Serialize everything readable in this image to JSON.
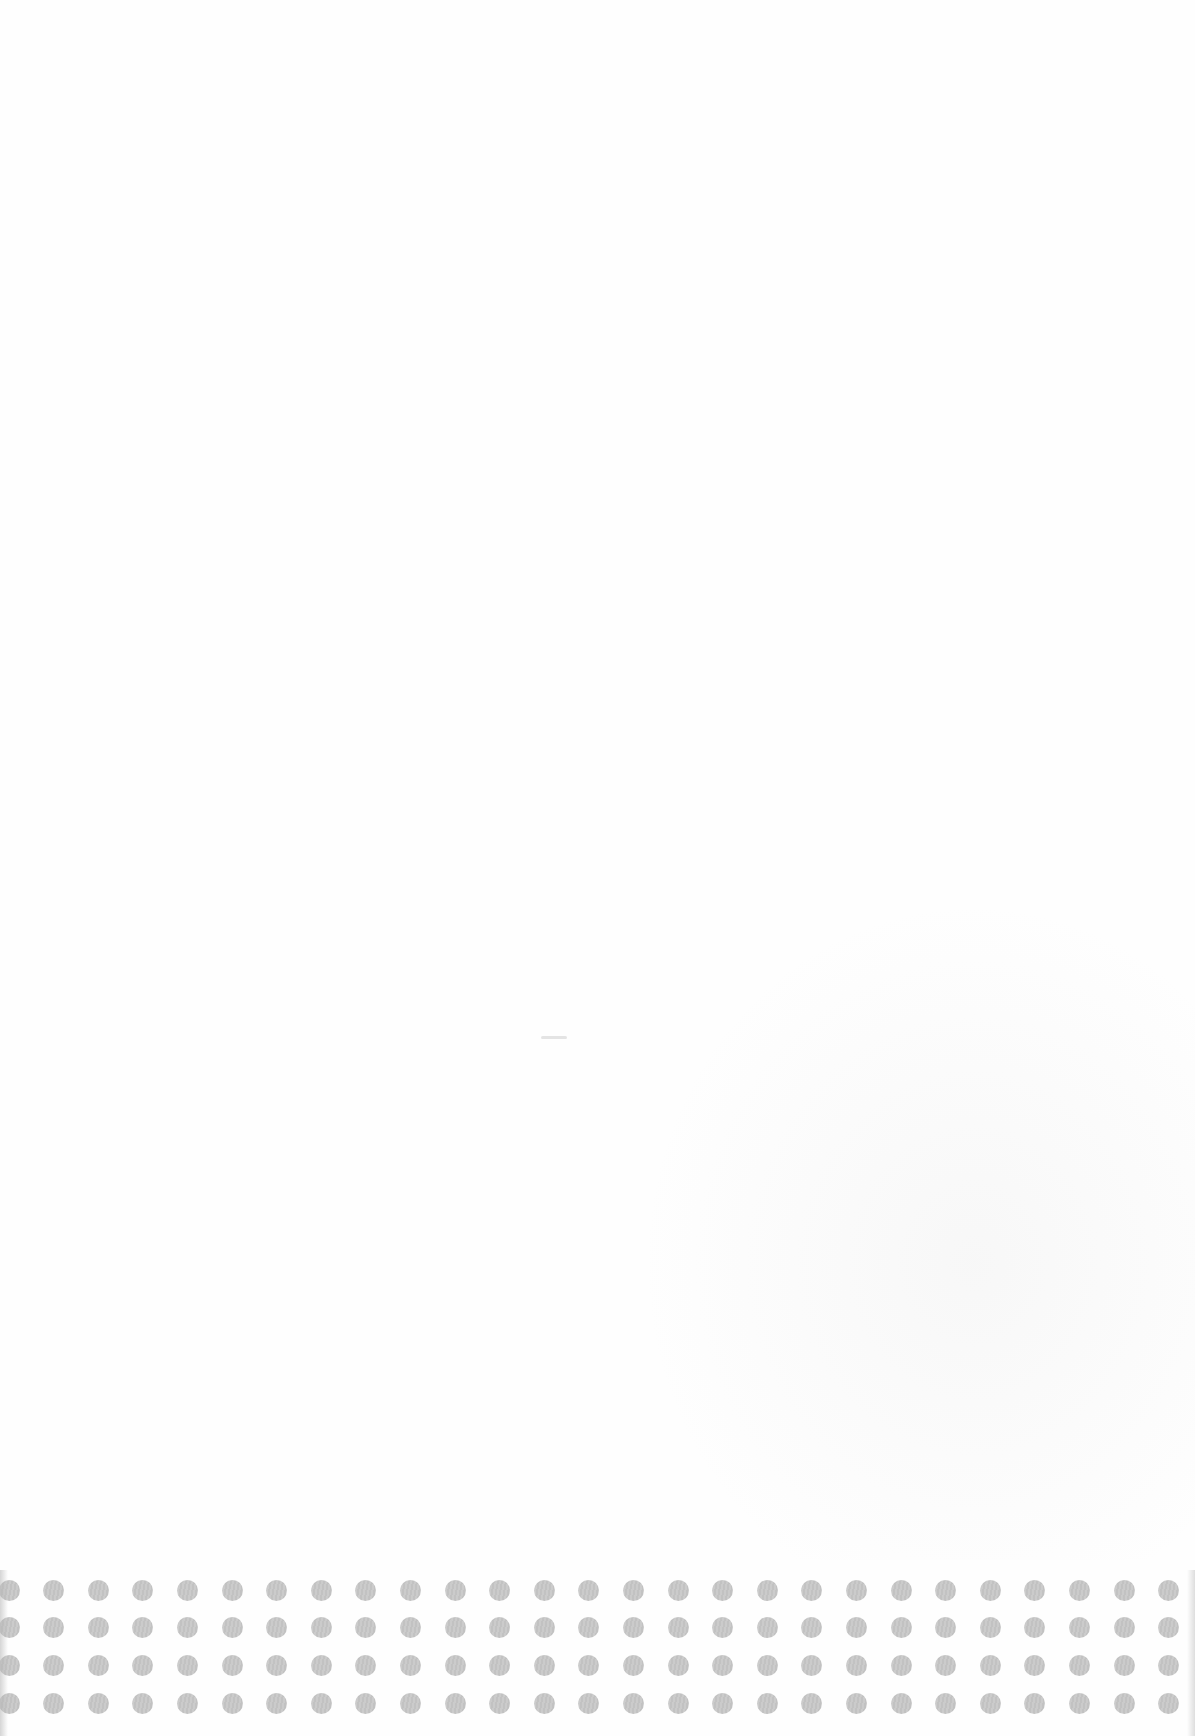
{
  "document": {
    "type": "scanned-blank-page",
    "background_color": "#fefefe",
    "text_content": ""
  },
  "decoration": {
    "name": "halftone-dot-grid",
    "dot_color": "#c4c4c4",
    "rows": 4,
    "columns": 27,
    "dot_diameter_px": 21,
    "row_centers_y": [
      1590,
      1627,
      1665,
      1703
    ],
    "first_column_center_x": 9,
    "column_spacing_px": 44.6
  }
}
